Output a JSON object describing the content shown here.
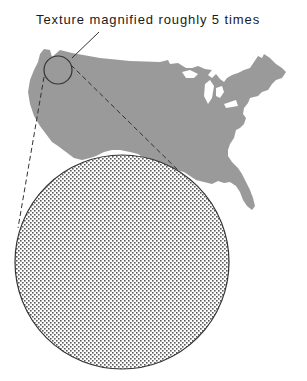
{
  "figure": {
    "caption": "Texture magnified roughly 5 times",
    "map_label": "United States outline",
    "colors": {
      "map_fill": "#9a9a9a",
      "outline": "#333333",
      "dot": "#5a5a5a",
      "background": "#ffffff"
    },
    "magnifier": {
      "small_circle": {
        "cx": 58,
        "cy": 70,
        "r": 14
      },
      "large_circle": {
        "cx": 122,
        "cy": 262,
        "r": 107
      },
      "magnification": "5x"
    }
  }
}
